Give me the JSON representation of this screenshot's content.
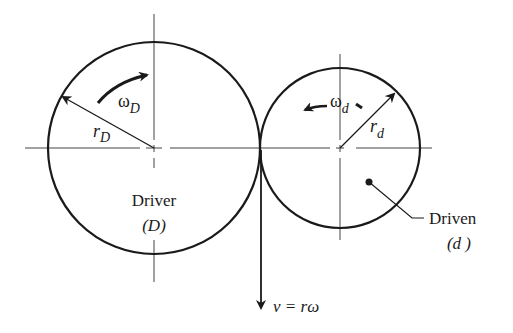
{
  "diagram": {
    "driver": {
      "label": "Driver",
      "symbol": "(D)",
      "omega_label": "ω",
      "omega_sub": "D",
      "radius_label": "r",
      "radius_sub": "D",
      "center": [
        154,
        148
      ],
      "radius": 106
    },
    "driven": {
      "label": "Driven",
      "symbol": "(d )",
      "omega_label": "ω",
      "omega_sub": "d",
      "radius_label": "r",
      "radius_sub": "d",
      "center": [
        340,
        148
      ],
      "radius": 80
    },
    "velocity_label": "v = rω",
    "colors": {
      "stroke": "#1a1a1a",
      "centerline": "#444444",
      "background": "#ffffff"
    }
  }
}
